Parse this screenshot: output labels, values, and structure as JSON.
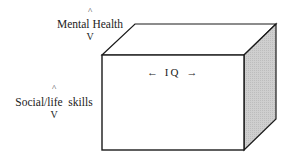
{
  "diagram": {
    "type": "3d-box",
    "colors": {
      "stroke": "#1a1a1a",
      "front_face": "#ffffff",
      "top_face": "#ffffff",
      "side_face": "#c9c9c9",
      "background": "#ffffff"
    },
    "vertical_axis_top": {
      "up_marker": "^",
      "label": "Mental Health",
      "down_marker": "V"
    },
    "vertical_axis_front": {
      "up_marker": "^",
      "label": "Social/life  skills",
      "down_marker": "V"
    },
    "horizontal_axis": {
      "left_arrow": "←",
      "label": "IQ",
      "right_arrow": "→",
      "full_text": "← I Q →"
    }
  }
}
